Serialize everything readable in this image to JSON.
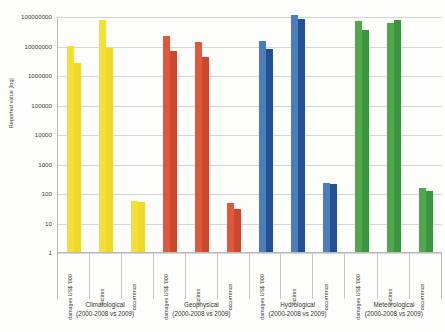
{
  "chart_data": {
    "type": "bar",
    "title": "",
    "xlabel": "",
    "ylabel": "Reported value [log]",
    "scale": "log",
    "ylim": [
      1,
      100000000
    ],
    "yticks": [
      1,
      10,
      100,
      1000,
      10000,
      100000,
      1000000,
      10000000,
      100000000
    ],
    "ytick_labels": [
      "1",
      "10",
      "100",
      "1000",
      "10000",
      "100000",
      "1000000",
      "10000000",
      "100000000"
    ],
    "grid": true,
    "legend": "none",
    "measures": [
      "damages US$ '000",
      "victims",
      "occurrence"
    ],
    "series_names": [
      "2000-2008",
      "2009"
    ],
    "period_caption": "(2000-2008 vs 2009)",
    "groups": [
      {
        "name": "Climatological",
        "caption": "(2000-2008 vs 2009)",
        "color": "#F2E033",
        "color2": "#EFD92B",
        "measures": [
          {
            "label": "damages US$ '000",
            "values": [
              10000000,
              2600000
            ]
          },
          {
            "label": "victims",
            "values": [
              75000000,
              8500000
            ]
          },
          {
            "label": "occurrence",
            "values": [
              55,
              50
            ]
          }
        ]
      },
      {
        "name": "Geophysical",
        "caption": "(2000-2008 vs 2009)",
        "color": "#E0573A",
        "color2": "#C8492F",
        "measures": [
          {
            "label": "damages US$ '000",
            "values": [
              21000000,
              6500000
            ]
          },
          {
            "label": "victims",
            "values": [
              13000000,
              4000000
            ]
          },
          {
            "label": "occurrence",
            "values": [
              45,
              28
            ]
          }
        ]
      },
      {
        "name": "Hydrological",
        "caption": "(2000-2008 vs 2009)",
        "color": "#4B7DBE",
        "color2": "#23508E",
        "measures": [
          {
            "label": "damages US$ '000",
            "values": [
              14000000,
              7800000
            ]
          },
          {
            "label": "victims",
            "values": [
              110000000,
              78000000
            ]
          },
          {
            "label": "occurrence",
            "values": [
              220,
              210
            ]
          }
        ]
      },
      {
        "name": "Meteorological",
        "caption": "(2000-2008 vs 2009)",
        "color": "#4FA84C",
        "color2": "#3C9340",
        "measures": [
          {
            "label": "damages US$ '000",
            "values": [
              70000000,
              33000000
            ]
          },
          {
            "label": "victims",
            "values": [
              60000000,
              72000000
            ]
          },
          {
            "label": "occurrence",
            "values": [
              145,
              120
            ]
          }
        ]
      }
    ]
  }
}
